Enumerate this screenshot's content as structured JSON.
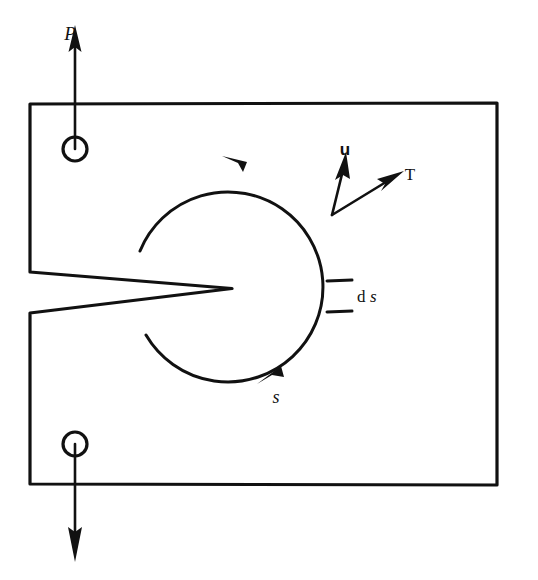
{
  "figure": {
    "background_color": "#ffffff",
    "ink_color": "#111111",
    "width": 538,
    "height": 580
  },
  "labels": {
    "load_top": "P",
    "displacement_vector": "u",
    "traction_vector": "T",
    "arc_coordinate": "s",
    "arc_element_d": "d",
    "arc_element_s": "s"
  },
  "geometry": {
    "plate": {
      "left": 30,
      "top": 103,
      "right": 497,
      "bottom": 485
    },
    "crack": {
      "tip_x": 232,
      "tip_y": 288,
      "mouth_x": 30,
      "upper_face_y": 272,
      "lower_face_y": 313
    },
    "contour": {
      "center_x": 232,
      "center_y": 288,
      "radius": 95
    },
    "pin_top": {
      "cx": 75,
      "cy": 149,
      "r": 12
    },
    "pin_bottom": {
      "cx": 75,
      "cy": 444,
      "r": 12
    },
    "vector_origin": {
      "x": 332,
      "y": 215
    },
    "vector_u_tip": {
      "x": 344,
      "y": 162
    },
    "vector_T_tip": {
      "x": 398,
      "y": 175
    },
    "arc_arrow_top": {
      "x": 234,
      "y": 158
    },
    "arc_arrow_bottom": {
      "x": 268,
      "y": 376
    },
    "ds_tick_upper_y": 281,
    "ds_tick_lower_y": 311
  },
  "label_positions": {
    "P": {
      "x": 70,
      "y": 40
    },
    "u": {
      "x": 345,
      "y": 155
    },
    "T": {
      "x": 410,
      "y": 180
    },
    "s": {
      "x": 276,
      "y": 403
    },
    "ds": {
      "x": 355,
      "y": 300
    }
  },
  "annotations": {
    "contour_direction": "counterclockwise",
    "top_load_direction": "up",
    "bottom_load_direction": "down"
  }
}
